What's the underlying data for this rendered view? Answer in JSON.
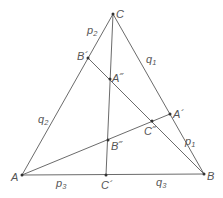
{
  "diagram": {
    "title": "",
    "points": {
      "A": "A",
      "B": "B",
      "C": "C",
      "A1": "A´",
      "B1": "B´",
      "C1": "C´",
      "A2": "A˝",
      "B2": "B˝",
      "C2": "C˝"
    },
    "segment_labels": {
      "p1": {
        "base": "p",
        "sub": "1"
      },
      "p2": {
        "base": "p",
        "sub": "2"
      },
      "p3": {
        "base": "p",
        "sub": "3"
      },
      "q1": {
        "base": "q",
        "sub": "1"
      },
      "q2": {
        "base": "q",
        "sub": "2"
      },
      "q3": {
        "base": "q",
        "sub": "3"
      }
    },
    "colors": {
      "line": "#6b6b6b",
      "point": "#333333",
      "label": "#555555"
    }
  }
}
